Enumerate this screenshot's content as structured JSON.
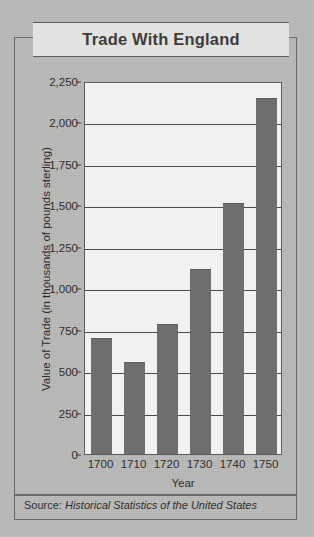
{
  "chart_data": {
    "type": "bar",
    "title": "Trade With England",
    "xlabel": "Year",
    "ylabel": "Value of Trade (in thousands of pounds sterling)",
    "categories": [
      "1700",
      "1710",
      "1720",
      "1730",
      "1740",
      "1750"
    ],
    "values": [
      710,
      565,
      795,
      1128,
      1525,
      2160
    ],
    "ylim": [
      0,
      2250
    ],
    "ytick_values": [
      0,
      250,
      500,
      750,
      1000,
      1250,
      1500,
      1750,
      2000,
      2250
    ],
    "ytick_labels": [
      "0",
      "250",
      "500",
      "750",
      "1,000",
      "1,250",
      "1,500",
      "1,750",
      "2,000",
      "2,250"
    ],
    "grid": true,
    "legend": null,
    "series": [
      {
        "name": "Value of Trade",
        "values": [
          710,
          565,
          795,
          1128,
          1525,
          2160
        ]
      }
    ]
  },
  "source": {
    "prefix": "Source: ",
    "title": "Historical Statistics of the United States"
  },
  "colors": {
    "bar": "#6e6e6c",
    "plot_background": "#f1f1ef",
    "page_background": "#b9b9b7",
    "title_plaque": "#e2e2e0",
    "frame": "#6a6a68",
    "gridline": "#4a4a48",
    "text": "#2e2e2c"
  }
}
